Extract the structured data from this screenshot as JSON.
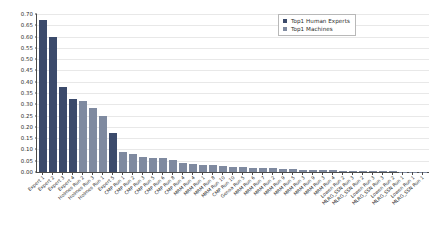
{
  "chart_data": {
    "type": "bar",
    "title": "",
    "xlabel": "",
    "ylabel": "",
    "ylim": [
      0.0,
      0.7
    ],
    "yticks": [
      "0.00",
      "0.05",
      "0.10",
      "0.15",
      "0.20",
      "0.25",
      "0.30",
      "0.35",
      "0.40",
      "0.45",
      "0.50",
      "0.55",
      "0.60",
      "0.65",
      "0.70"
    ],
    "ytick_values": [
      0.0,
      0.05,
      0.1,
      0.15,
      0.2,
      0.25,
      0.3,
      0.35,
      0.4,
      0.45,
      0.5,
      0.55,
      0.6,
      0.65,
      0.7
    ],
    "grid": true,
    "grid_axis": "y",
    "legend_position": "upper right",
    "legend": [
      {
        "label": "Top1 Human Experts",
        "color": "#3b4a6b"
      },
      {
        "label": "Top1 Machines",
        "color": "#7f8aa0"
      }
    ],
    "categories": [
      "Expert 1",
      "Expert 2",
      "Expert 3",
      "Expert 4",
      "Holmes Run 2",
      "Holmes Run 3",
      "Holmes Run 1",
      "Expert 5",
      "CMP Run 1",
      "CMP Run 2",
      "CMP Run 3",
      "CMP Run 5",
      "CMP Run 6",
      "CMP Run 8",
      "CMP Run 4",
      "MRM Run 4",
      "MRM Run 1",
      "MRM Run 8",
      "MRM Run 10",
      "CMP Run 10",
      "Genoa Run 5",
      "MRM Run 6",
      "MRM Run 7",
      "MRM Run 2",
      "MRM Run 9",
      "MRM Run 5",
      "MRM Run 3",
      "MRM Run 9",
      "MRM Run 3",
      "MRM Run 4",
      "Lowen Run 2",
      "MLRG_SSN Run 3",
      "MLRG_SSN Run 2",
      "Lowen Run 3",
      "MLRG_SSN Run 3",
      "Lowen Run 2",
      "MLRG_SSN Run 1",
      "Lowen Run 1",
      "MLRG_SSN Run 1"
    ],
    "series": [
      {
        "name": "Top1 Human Experts",
        "color": "#3b4a6b"
      },
      {
        "name": "Top1 Machines",
        "color": "#7f8aa0"
      }
    ],
    "bars": [
      {
        "label": "Expert 1",
        "value": 0.675,
        "series": "Top1 Human Experts"
      },
      {
        "label": "Expert 2",
        "value": 0.6,
        "series": "Top1 Human Experts"
      },
      {
        "label": "Expert 3",
        "value": 0.375,
        "series": "Top1 Human Experts"
      },
      {
        "label": "Expert 4",
        "value": 0.325,
        "series": "Top1 Human Experts"
      },
      {
        "label": "Holmes Run 2",
        "value": 0.315,
        "series": "Top1 Machines"
      },
      {
        "label": "Holmes Run 3",
        "value": 0.285,
        "series": "Top1 Machines"
      },
      {
        "label": "Holmes Run 1",
        "value": 0.25,
        "series": "Top1 Machines"
      },
      {
        "label": "Expert 5",
        "value": 0.175,
        "series": "Top1 Human Experts"
      },
      {
        "label": "CMP Run 1",
        "value": 0.09,
        "series": "Top1 Machines"
      },
      {
        "label": "CMP Run 2",
        "value": 0.078,
        "series": "Top1 Machines"
      },
      {
        "label": "CMP Run 3",
        "value": 0.065,
        "series": "Top1 Machines"
      },
      {
        "label": "CMP Run 5",
        "value": 0.062,
        "series": "Top1 Machines"
      },
      {
        "label": "CMP Run 6",
        "value": 0.06,
        "series": "Top1 Machines"
      },
      {
        "label": "CMP Run 8",
        "value": 0.055,
        "series": "Top1 Machines"
      },
      {
        "label": "CMP Run 4",
        "value": 0.042,
        "series": "Top1 Machines"
      },
      {
        "label": "MRM Run 4",
        "value": 0.036,
        "series": "Top1 Machines"
      },
      {
        "label": "MRM Run 1",
        "value": 0.032,
        "series": "Top1 Machines"
      },
      {
        "label": "MRM Run 8",
        "value": 0.03,
        "series": "Top1 Machines"
      },
      {
        "label": "MRM Run 10",
        "value": 0.028,
        "series": "Top1 Machines"
      },
      {
        "label": "CMP Run 10",
        "value": 0.024,
        "series": "Top1 Machines"
      },
      {
        "label": "Genoa Run 5",
        "value": 0.022,
        "series": "Top1 Machines"
      },
      {
        "label": "MRM Run 6",
        "value": 0.02,
        "series": "Top1 Machines"
      },
      {
        "label": "MRM Run 7",
        "value": 0.018,
        "series": "Top1 Machines"
      },
      {
        "label": "MRM Run 2",
        "value": 0.016,
        "series": "Top1 Machines"
      },
      {
        "label": "MRM Run 9",
        "value": 0.014,
        "series": "Top1 Machines"
      },
      {
        "label": "MRM Run 5",
        "value": 0.012,
        "series": "Top1 Machines"
      },
      {
        "label": "MRM Run 3",
        "value": 0.01,
        "series": "Top1 Machines"
      },
      {
        "label": "MRM Run 9",
        "value": 0.009,
        "series": "Top1 Machines"
      },
      {
        "label": "MRM Run 3",
        "value": 0.008,
        "series": "Top1 Machines"
      },
      {
        "label": "MRM Run 4",
        "value": 0.007,
        "series": "Top1 Machines"
      },
      {
        "label": "Lowen Run 2",
        "value": 0.006,
        "series": "Top1 Machines"
      },
      {
        "label": "MLRG_SSN Run 3",
        "value": 0.005,
        "series": "Top1 Machines"
      },
      {
        "label": "MLRG_SSN Run 2",
        "value": 0.004,
        "series": "Top1 Machines"
      },
      {
        "label": "Lowen Run 3",
        "value": 0.004,
        "series": "Top1 Machines"
      },
      {
        "label": "MLRG_SSN Run 3",
        "value": 0.003,
        "series": "Top1 Machines"
      },
      {
        "label": "Lowen Run 2",
        "value": 0.003,
        "series": "Top1 Machines"
      },
      {
        "label": "MLRG_SSN Run 1",
        "value": 0.002,
        "series": "Top1 Machines"
      },
      {
        "label": "Lowen Run 1",
        "value": 0.001,
        "series": "Top1 Machines"
      },
      {
        "label": "MLRG_SSN Run 1",
        "value": 0.001,
        "series": "Top1 Machines"
      }
    ]
  },
  "colors": {
    "human_experts": "#3b4a6b",
    "machines": "#7f8aa0",
    "axis": "#4a4a4a",
    "grid": "#e8e8e8",
    "background": "#ffffff",
    "text": "#2b2b2b"
  }
}
